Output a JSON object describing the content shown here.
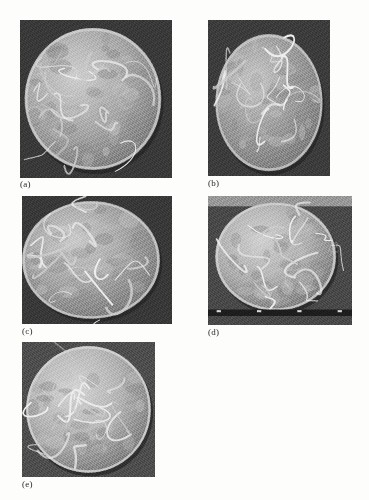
{
  "figure": {
    "type": "photographic-plate",
    "rendering": "grayscale halftone scan",
    "page_background": "#fdfdfb",
    "caption_color": "#2a2a2a",
    "panel_count": 5,
    "panels": [
      {
        "id": "a",
        "caption": "(a)",
        "x": 20,
        "y": 20,
        "width": 152,
        "height": 158,
        "caption_x": 20,
        "caption_y": 179,
        "background_tone": "#3a3a3a",
        "dish": {
          "cx_pct": 48,
          "cy_pct": 50,
          "r_pct": 45,
          "fill": "#a9a9a9",
          "rim": "#cfcfcf",
          "contents": "dense mat of pale seedling roots and shoots filling the dish"
        },
        "background_variant": "uniform-dark"
      },
      {
        "id": "b",
        "caption": "(b)",
        "x": 208,
        "y": 20,
        "width": 122,
        "height": 156,
        "caption_x": 208,
        "caption_y": 178,
        "background_tone": "#3d3d3d",
        "dish": {
          "cx_pct": 50,
          "cy_pct": 53,
          "r_pct": 44,
          "fill": "#9e9e9e",
          "rim": "#c8c8c8",
          "contents": "a few long curved seedlings looping across the dish, stray shoots crossing the frame"
        },
        "background_variant": "uniform-dark"
      },
      {
        "id": "c",
        "caption": "(c)",
        "x": 22,
        "y": 196,
        "width": 150,
        "height": 128,
        "caption_x": 22,
        "caption_y": 326,
        "background_tone": "#393939",
        "dish": {
          "cx_pct": 46,
          "cy_pct": 50,
          "r_pct": 46,
          "fill": "#a5a5a5",
          "rim": "#cccccc",
          "contents": "mottled dish with several seedlings radiating outward past the rim"
        },
        "background_variant": "uniform-dark"
      },
      {
        "id": "d",
        "caption": "(d)",
        "x": 208,
        "y": 196,
        "width": 144,
        "height": 129,
        "caption_x": 208,
        "caption_y": 327,
        "background_tone": "#4a4a4a",
        "dish": {
          "cx_pct": 47,
          "cy_pct": 47,
          "r_pct": 42,
          "fill": "#b0b0b0",
          "rim": "#d2d2d2",
          "contents": "dish with many fine seedling roots sprawling beyond the rim"
        },
        "background_variant": "light-top-dark-strip",
        "strip": {
          "present": true,
          "position": "near-bottom",
          "tone": "#1e1e1e",
          "tick_marks": 4
        }
      },
      {
        "id": "e",
        "caption": "(e)",
        "x": 22,
        "y": 342,
        "width": 133,
        "height": 135,
        "caption_x": 22,
        "caption_y": 479,
        "background_tone": "#4f4f4f",
        "dish": {
          "cx_pct": 50,
          "cy_pct": 50,
          "r_pct": 47,
          "fill": "#b4b4b4",
          "rim": "#d6d6d6",
          "contents": "pale dish crossed by long looping white seedling shoots"
        },
        "background_variant": "uniform-medium"
      }
    ]
  }
}
